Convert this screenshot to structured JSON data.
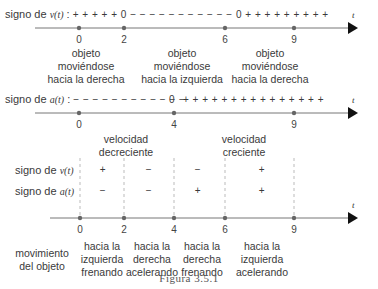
{
  "axis_variable": "t",
  "diagram1": {
    "sign_label_prefix": "signo de ",
    "sign_label_func": "v(t)",
    "sign_label_colon": " :",
    "sign_sequence": "+ + + + + 0 − − − − − − − − − − − 0 + + + + + + + + +",
    "ticks": [
      "0",
      "2",
      "6",
      "9"
    ],
    "blocks": [
      {
        "lines": [
          "objeto",
          "moviéndose",
          "hacia la derecha"
        ]
      },
      {
        "lines": [
          "objeto",
          "moviéndose",
          "hacia la izquierda"
        ]
      },
      {
        "lines": [
          "objeto",
          "moviéndose",
          "hacia la derecha"
        ]
      }
    ]
  },
  "diagram2": {
    "sign_label_prefix": "signo de ",
    "sign_label_func": "a(t)",
    "sign_label_colon": " :",
    "sign_sequence_neg": "− − − − − − − − − − − −",
    "sign_zero": "0",
    "sign_sequence_pos": "+ + + + + + + + + + + + + + +",
    "ticks": [
      "0",
      "4",
      "9"
    ],
    "blocks": [
      {
        "lines": [
          "velocidad",
          "decreciente"
        ]
      },
      {
        "lines": [
          "velocidad",
          "creciente"
        ]
      }
    ]
  },
  "diagram3": {
    "row_v": {
      "prefix": "signo de ",
      "func": "v(t)",
      "signs": [
        "+",
        "−",
        "−",
        "+"
      ]
    },
    "row_a": {
      "prefix": "signo de ",
      "func": "a(t)",
      "signs": [
        "−",
        "−",
        "+",
        "+"
      ]
    },
    "ticks": [
      "0",
      "2",
      "4",
      "6",
      "9"
    ],
    "motion_label": [
      "movimiento",
      "del objeto"
    ],
    "blocks": [
      {
        "lines": [
          "hacia la",
          "izquierda",
          "frenando"
        ]
      },
      {
        "lines": [
          "hacia la",
          "derecha",
          "acelerando"
        ]
      },
      {
        "lines": [
          "hacia la",
          "derecha",
          "frenando"
        ]
      },
      {
        "lines": [
          "hacia la",
          "izquierda",
          "acelerando"
        ]
      }
    ]
  },
  "caption": "Figura 3.5.1",
  "colors": {
    "axis": "#6e6e6e",
    "dot": "#666666",
    "arrow": "#111111",
    "dash": "#aaaaaa"
  }
}
